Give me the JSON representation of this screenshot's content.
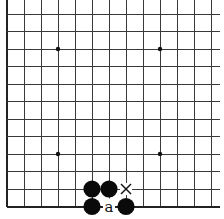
{
  "diagram": {
    "type": "go-board-fragment",
    "corner": "bottom-left",
    "visible_columns": 13,
    "visible_rows": 12,
    "spacing_x": 17,
    "spacing_y": 17.5,
    "origin": {
      "x": 7,
      "y": 14
    },
    "board_edges": {
      "left": true,
      "bottom": true,
      "top": false,
      "right": false
    },
    "colors": {
      "line": "#3a3a3a",
      "edge": "#222222",
      "stone_black": "#0a0a0a",
      "background": "#ffffff"
    },
    "star_points": [
      {
        "col": 3,
        "row": 2
      },
      {
        "col": 9,
        "row": 2
      },
      {
        "col": 3,
        "row": 8
      },
      {
        "col": 9,
        "row": 8
      }
    ],
    "stones": [
      {
        "color": "black",
        "col": 5,
        "row": 10
      },
      {
        "color": "black",
        "col": 6,
        "row": 10
      },
      {
        "color": "black",
        "col": 5,
        "row": 11
      },
      {
        "color": "black",
        "col": 7,
        "row": 11
      }
    ],
    "marks": [
      {
        "type": "cross",
        "symbol": "×",
        "col": 7,
        "row": 10
      },
      {
        "type": "letter",
        "text": "a",
        "col": 6,
        "row": 11
      }
    ]
  }
}
